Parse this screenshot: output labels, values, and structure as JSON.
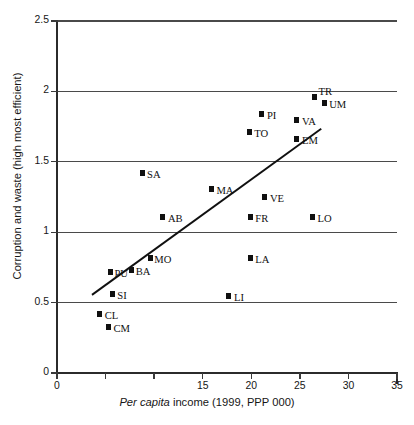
{
  "chart_data": {
    "type": "scatter",
    "title": "",
    "xlabel": "Per capita income (1999, PPP 000)",
    "xlabel_italic_part": "Per capita",
    "xlabel_rest": " income (1999, PPP 000)",
    "ylabel": "Corruption and waste (high most efficient)",
    "xlim": [
      0,
      35
    ],
    "ylim": [
      0,
      2.5
    ],
    "xticks": [
      0,
      5,
      10,
      15,
      20,
      25,
      30,
      35
    ],
    "xtick_labels": [
      "0",
      "",
      "",
      "15",
      "20",
      "25",
      "30",
      "35"
    ],
    "yticks": [
      0,
      0.5,
      1,
      1.5,
      2,
      2.5
    ],
    "ytick_labels": [
      "0",
      "0.5",
      "1",
      "1.5",
      "2",
      "2.5"
    ],
    "grid": "horizontal",
    "legend": "none",
    "points": [
      {
        "label": "TR",
        "x": 26.5,
        "y": 1.96,
        "lx": 4,
        "ly": -11
      },
      {
        "label": "UM",
        "x": 27.5,
        "y": 1.92,
        "lx": 5,
        "ly": -4
      },
      {
        "label": "PI",
        "x": 21.1,
        "y": 1.84,
        "lx": 5,
        "ly": -4
      },
      {
        "label": "VA",
        "x": 24.7,
        "y": 1.8,
        "lx": 5,
        "ly": -4
      },
      {
        "label": "TO",
        "x": 19.8,
        "y": 1.71,
        "lx": 5,
        "ly": -4
      },
      {
        "label": "EM",
        "x": 24.7,
        "y": 1.66,
        "lx": 5,
        "ly": -4
      },
      {
        "label": "SA",
        "x": 8.75,
        "y": 1.42,
        "lx": 5,
        "ly": -4
      },
      {
        "label": "MA",
        "x": 15.9,
        "y": 1.31,
        "lx": 5,
        "ly": -4
      },
      {
        "label": "VE",
        "x": 21.4,
        "y": 1.25,
        "lx": 5,
        "ly": -4
      },
      {
        "label": "AB",
        "x": 10.9,
        "y": 1.11,
        "lx": 5,
        "ly": -4
      },
      {
        "label": "FR",
        "x": 19.9,
        "y": 1.11,
        "lx": 5,
        "ly": -4
      },
      {
        "label": "LO",
        "x": 26.3,
        "y": 1.11,
        "lx": 5,
        "ly": -4
      },
      {
        "label": "MO",
        "x": 9.6,
        "y": 0.82,
        "lx": 4,
        "ly": -4
      },
      {
        "label": "LA",
        "x": 19.9,
        "y": 0.82,
        "lx": 5,
        "ly": -4
      },
      {
        "label": "PU",
        "x": 5.5,
        "y": 0.72,
        "lx": 4,
        "ly": -4
      },
      {
        "label": "BA",
        "x": 7.7,
        "y": 0.73,
        "lx": 4,
        "ly": -4
      },
      {
        "label": "SI",
        "x": 5.7,
        "y": 0.56,
        "lx": 5,
        "ly": -4
      },
      {
        "label": "LI",
        "x": 17.7,
        "y": 0.55,
        "lx": 5,
        "ly": -4
      },
      {
        "label": "CL",
        "x": 4.4,
        "y": 0.42,
        "lx": 5,
        "ly": -4
      },
      {
        "label": "CM",
        "x": 5.3,
        "y": 0.33,
        "lx": 5,
        "ly": -4
      }
    ],
    "trendline": {
      "x1": 3.6,
      "y1": 0.555,
      "x2": 27.2,
      "y2": 1.735
    }
  }
}
